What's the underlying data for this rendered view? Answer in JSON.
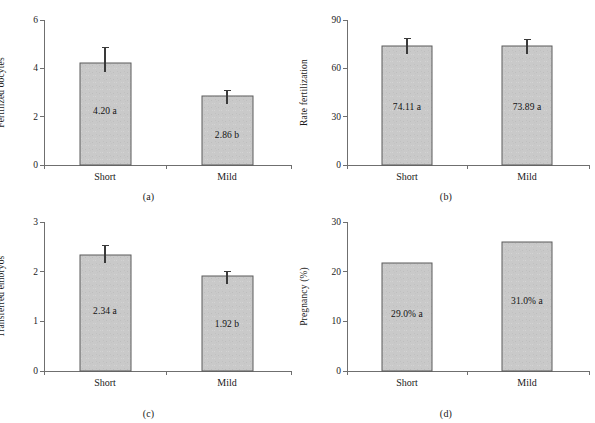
{
  "figure": {
    "background": "#ffffff",
    "bar_fill": "#c9c9c9",
    "bar_stroke": "#5a5a5a",
    "axis_color": "#6f6f6f",
    "error_color": "#3a3a3a",
    "panel_captions": [
      "(a)",
      "(b)",
      "(c)",
      "(d)"
    ]
  },
  "chart_data": [
    {
      "type": "bar",
      "panel": "(a)",
      "title": "",
      "xlabel": "",
      "ylabel": "Fertilized oocytes",
      "categories": [
        "Short",
        "Mild"
      ],
      "values": [
        4.2,
        2.86
      ],
      "errors": [
        0.67,
        0.22
      ],
      "data_labels": [
        "4.20 a",
        "2.86 b"
      ],
      "ylim": [
        0,
        6
      ],
      "yticks": [
        0,
        2,
        4,
        6
      ],
      "ytick_labels": [
        "0",
        "2",
        "4",
        "6"
      ],
      "grid": false,
      "legend": "none"
    },
    {
      "type": "bar",
      "panel": "(b)",
      "title": "",
      "xlabel": "",
      "ylabel": "Rate fertilization",
      "categories": [
        "Short",
        "Mild"
      ],
      "values": [
        74.11,
        73.89
      ],
      "errors": [
        4.6,
        4.0
      ],
      "data_labels": [
        "74.11 a",
        "73.89 a"
      ],
      "ylim": [
        0,
        90
      ],
      "yticks": [
        0,
        30,
        60,
        90
      ],
      "ytick_labels": [
        "0",
        "30",
        "60",
        "90"
      ],
      "grid": false,
      "legend": "none"
    },
    {
      "type": "bar",
      "panel": "(c)",
      "title": "",
      "xlabel": "",
      "ylabel": "Transferred embryos",
      "categories": [
        "Short",
        "Mild"
      ],
      "values": [
        2.34,
        1.92
      ],
      "errors": [
        0.19,
        0.09
      ],
      "data_labels": [
        "2.34 a",
        "1.92 b"
      ],
      "ylim": [
        0,
        3
      ],
      "yticks": [
        0,
        1,
        2,
        3
      ],
      "ytick_labels": [
        "0",
        "1",
        "2",
        "3"
      ],
      "grid": false,
      "legend": "none"
    },
    {
      "type": "bar",
      "panel": "(d)",
      "title": "",
      "xlabel": "",
      "ylabel": "Pregnancy (%)",
      "categories": [
        "Short",
        "Mild"
      ],
      "values": [
        21.8,
        26.0
      ],
      "errors": [
        0,
        0
      ],
      "data_labels": [
        "29.0% a",
        "31.0% a"
      ],
      "ylim": [
        0,
        30
      ],
      "yticks": [
        0,
        10,
        20,
        30
      ],
      "ytick_labels": [
        "0",
        "10",
        "20",
        "30"
      ],
      "grid": false,
      "legend": "none"
    }
  ]
}
